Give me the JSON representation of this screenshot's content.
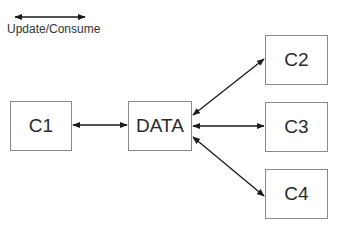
{
  "legend": {
    "label": "Update/Consume",
    "arrow": {
      "x1": 15,
      "y1": 17,
      "x2": 85,
      "y2": 17
    }
  },
  "nodes": {
    "c1": {
      "label": "C1",
      "x": 10,
      "y": 101,
      "w": 62,
      "h": 50
    },
    "data": {
      "label": "DATA",
      "x": 128,
      "y": 101,
      "w": 64,
      "h": 50
    },
    "c2": {
      "label": "C2",
      "x": 265,
      "y": 35,
      "w": 63,
      "h": 50
    },
    "c3": {
      "label": "C3",
      "x": 265,
      "y": 102,
      "w": 63,
      "h": 50
    },
    "c4": {
      "label": "C4",
      "x": 265,
      "y": 169,
      "w": 63,
      "h": 50
    }
  },
  "edges": [
    {
      "from": "C1",
      "to": "DATA",
      "type": "bidirectional"
    },
    {
      "from": "DATA",
      "to": "C2",
      "type": "bidirectional"
    },
    {
      "from": "DATA",
      "to": "C3",
      "type": "bidirectional"
    },
    {
      "from": "DATA",
      "to": "C4",
      "type": "bidirectional"
    }
  ],
  "colors": {
    "line": "#1a1a1a",
    "box_border": "#8a8a8a"
  }
}
